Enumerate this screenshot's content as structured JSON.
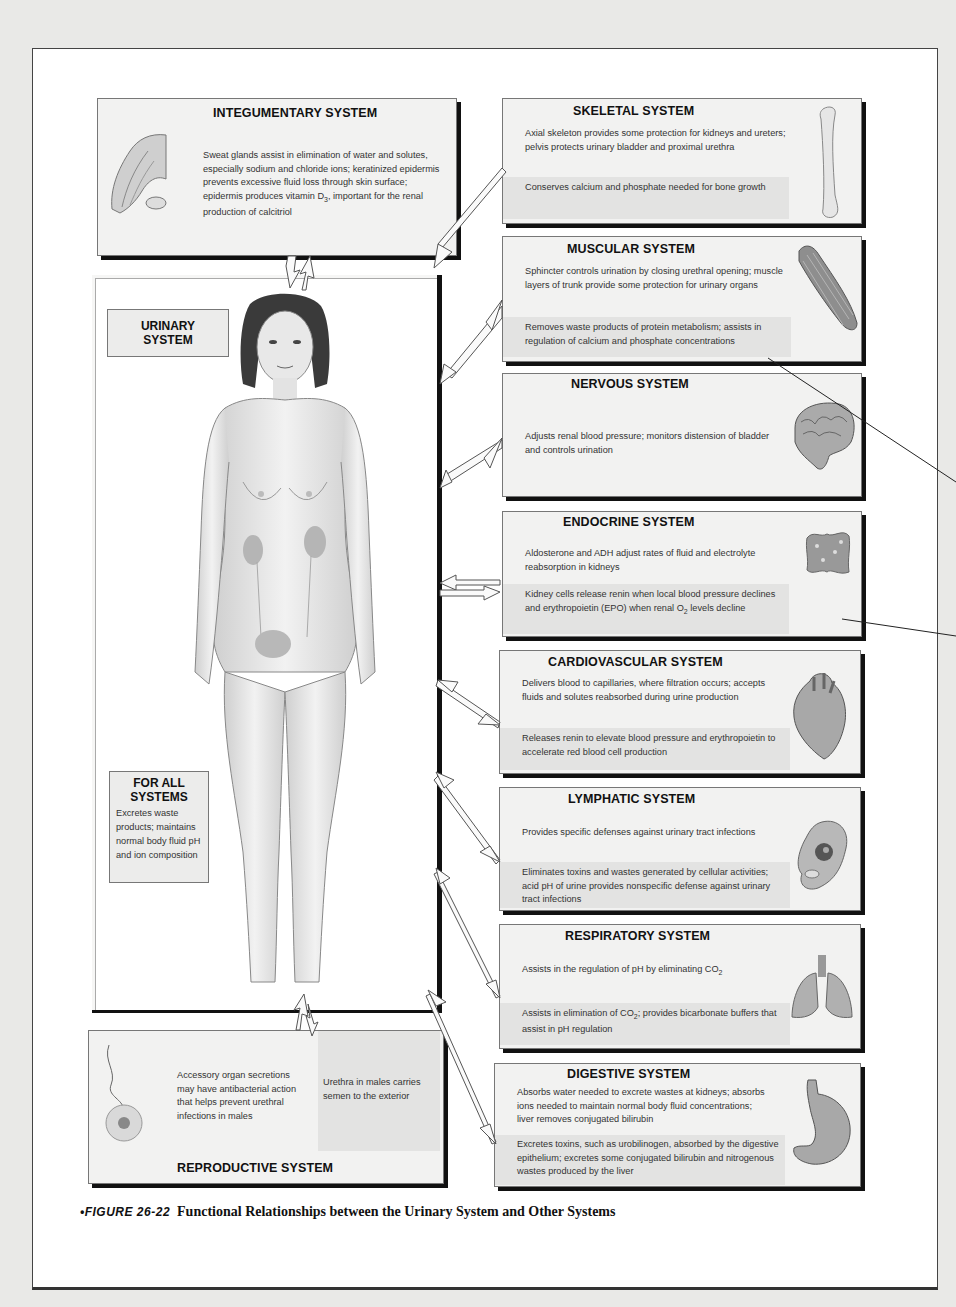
{
  "figure": {
    "label": "FIGURE 26-22",
    "bullet": "•",
    "title": "Functional Relationships between the Urinary System and Other Systems"
  },
  "center": {
    "label_line1": "URINARY",
    "label_line2": "SYSTEM",
    "for_all": {
      "heading_line1": "FOR ALL",
      "heading_line2": "SYSTEMS",
      "text": "Excretes waste products; maintains normal body fluid pH and ion composition"
    },
    "illustration": "female-body-with-kidneys-ureters-bladder"
  },
  "systems": {
    "integumentary": {
      "title": "INTEGUMENTARY SYSTEM",
      "text1": "Sweat glands assist in elimination of water and solutes, especially sodium and chloride ions; keratinized epidermis prevents excessive fluid loss through skin surface; epidermis produces vitamin D",
      "text1_sub": "3",
      "text1_tail": ", important for the renal production of calcitriol",
      "icon": "hand-skin-icon"
    },
    "skeletal": {
      "title": "SKELETAL SYSTEM",
      "text1": "Axial skeleton provides some protection for kidneys and ureters; pelvis protects urinary bladder and proximal urethra",
      "text2": "Conserves calcium and phosphate needed for bone growth",
      "icon": "bone-icon"
    },
    "muscular": {
      "title": "MUSCULAR SYSTEM",
      "text1": "Sphincter controls urination by closing urethral opening; muscle layers of trunk provide some protection for urinary organs",
      "text2": "Removes waste products of protein metabolism; assists in regulation of calcium and phosphate concentrations",
      "icon": "muscle-icon"
    },
    "nervous": {
      "title": "NERVOUS SYSTEM",
      "text1": "Adjusts renal blood pressure; monitors distension of bladder and controls urination",
      "icon": "brain-icon"
    },
    "endocrine": {
      "title": "ENDOCRINE SYSTEM",
      "text1": "Aldosterone and ADH adjust rates of fluid and electrolyte reabsorption in kidneys",
      "text2_a": "Kidney cells release renin when local blood pressure declines and erythropoietin (EPO) when renal O",
      "text2_sub": "2",
      "text2_b": " levels decline",
      "icon": "thyroid-gland-icon"
    },
    "cardiovascular": {
      "title": "CARDIOVASCULAR SYSTEM",
      "text1": "Delivers blood to capillaries, where filtration occurs; accepts fluids and solutes reabsorbed during urine production",
      "text2": "Releases renin to elevate blood pressure and erythropoietin to accelerate red blood cell production",
      "icon": "heart-icon"
    },
    "lymphatic": {
      "title": "LYMPHATIC SYSTEM",
      "text1": "Provides specific defenses against urinary tract infections",
      "text2": "Eliminates toxins and wastes generated by cellular activities; acid pH of urine provides nonspecific defense against urinary tract infections",
      "icon": "macrophage-cell-icon"
    },
    "respiratory": {
      "title": "RESPIRATORY SYSTEM",
      "text1_a": "Assists in the regulation of pH by eliminating CO",
      "text1_sub": "2",
      "text2_a": "Assists in elimination of CO",
      "text2_sub": "2",
      "text2_b": "; provides bicarbonate buffers that assist in pH regulation",
      "icon": "lungs-icon"
    },
    "digestive": {
      "title": "DIGESTIVE SYSTEM",
      "text1": "Absorbs water needed to excrete wastes at kidneys; absorbs ions needed to maintain normal body fluid concentrations; liver removes conjugated bilirubin",
      "text2": "Excretes toxins, such as urobilinogen, absorbed by the digestive epithelium; excretes some conjugated bilirubin and nitrogenous wastes produced by the liver",
      "icon": "stomach-icon"
    },
    "reproductive": {
      "title": "REPRODUCTIVE SYSTEM",
      "text1": "Accessory organ secretions may have antibacterial action that helps prevent urethral infections in males",
      "text2": "Urethra in males carries semen to the exterior",
      "icon": "sperm-egg-icon"
    }
  }
}
